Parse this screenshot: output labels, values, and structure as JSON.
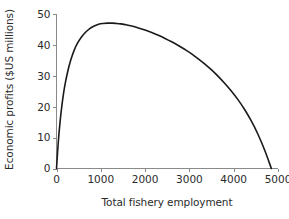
{
  "figure": {
    "background_color": "#ffffff",
    "text_color": "#2b2b2b",
    "axis_color": "#8a8a8a",
    "curve_color": "#1a1a1a"
  },
  "chart_data": {
    "type": "line",
    "title": "",
    "subtitle": "",
    "xlabel": "Total fishery employment",
    "ylabel": "Economic profits ($US millions)",
    "xlim": [
      0,
      5000
    ],
    "ylim": [
      0,
      50
    ],
    "xticks": [
      0,
      1000,
      2000,
      3000,
      4000,
      5000
    ],
    "yticks": [
      0,
      10,
      20,
      30,
      40,
      50
    ],
    "xtick_labels": [
      "0",
      "1000",
      "2000",
      "3000",
      "4000",
      "5000"
    ],
    "ytick_labels": [
      "0",
      "10",
      "20",
      "30",
      "40",
      "50"
    ],
    "grid": false,
    "legend": null,
    "legend_position": "none",
    "annotations": [],
    "series": [
      {
        "name": "Economic profits",
        "color": "#1a1a1a",
        "line_width": 1.6,
        "x": [
          0,
          40,
          80,
          120,
          160,
          200,
          260,
          320,
          400,
          480,
          560,
          650,
          750,
          850,
          950,
          1050,
          1150,
          1250,
          1350,
          1450,
          1550,
          1700,
          1850,
          2000,
          2150,
          2300,
          2450,
          2600,
          2750,
          2900,
          3050,
          3200,
          3350,
          3500,
          3650,
          3800,
          3950,
          4100,
          4250,
          4400,
          4550,
          4700,
          4850
        ],
        "y": [
          0,
          8.5,
          15.0,
          20.2,
          24.4,
          27.8,
          31.8,
          35.0,
          38.3,
          40.7,
          42.5,
          44.0,
          45.3,
          46.1,
          46.7,
          46.95,
          47.05,
          47.05,
          46.95,
          46.8,
          46.55,
          46.1,
          45.5,
          44.8,
          44.0,
          43.1,
          42.1,
          41.0,
          39.8,
          38.5,
          37.1,
          35.5,
          33.8,
          31.9,
          29.8,
          27.5,
          25.0,
          22.2,
          19.0,
          15.3,
          11.0,
          5.9,
          0
        ]
      }
    ],
    "peak": {
      "x": 1200,
      "y": 47
    },
    "zero_crossings": [
      0,
      4850
    ]
  }
}
